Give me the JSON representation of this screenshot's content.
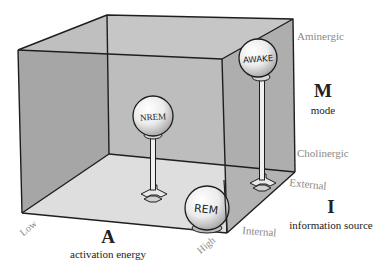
{
  "diagram": {
    "states": [
      {
        "label": "AWAKE"
      },
      {
        "label": "NREM"
      },
      {
        "label": "REM"
      }
    ],
    "axes": {
      "M": {
        "letter": "M",
        "name": "mode",
        "top_label": "Aminergic",
        "bottom_label": "Cholinergic"
      },
      "I": {
        "letter": "I",
        "name": "information source",
        "back_label": "External",
        "front_label": "Internal"
      },
      "A": {
        "letter": "A",
        "name": "activation energy",
        "low_label": "Low",
        "high_label": "High"
      }
    },
    "colors": {
      "left_wall": "#a6a6a6",
      "back_wall": "#bdbdbd",
      "right_wall": "#ababab",
      "floor": "#dedede",
      "top": "#cacaca",
      "edge": "#1e1e1e",
      "axis_value_text": "#8a8a8a",
      "axis_name_text": "#222222"
    }
  }
}
